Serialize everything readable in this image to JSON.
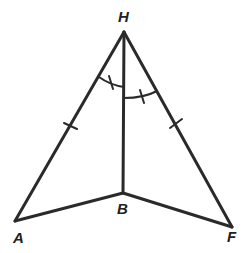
{
  "diagram": {
    "type": "geometry-figure",
    "stroke_color": "#2a2a2a",
    "points": [
      {
        "name": "H",
        "x": 124,
        "y": 32
      },
      {
        "name": "A",
        "x": 15,
        "y": 221
      },
      {
        "name": "B",
        "x": 123,
        "y": 193
      },
      {
        "name": "F",
        "x": 232,
        "y": 227
      }
    ],
    "labels": {
      "H": "H",
      "A": "A",
      "B": "B",
      "F": "F"
    },
    "segments": [
      "HA",
      "HB",
      "HF",
      "AB",
      "BF"
    ],
    "congruence_marks": {
      "sides": [
        "HA",
        "HF"
      ],
      "angles": [
        "AHB",
        "BHF"
      ]
    }
  }
}
